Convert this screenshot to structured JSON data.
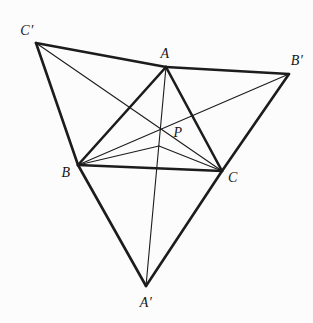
{
  "figure": {
    "background": "#fcfcfc",
    "stroke_color": "#1c1c1c",
    "thick_width": 2.6,
    "thin_width": 1.1,
    "points": {
      "Cp": [
        36,
        43
      ],
      "A": [
        166,
        67
      ],
      "Bp": [
        289,
        74
      ],
      "B": [
        78,
        165
      ],
      "C": [
        222,
        171
      ],
      "Ap": [
        146,
        286
      ],
      "P": [
        161,
        131
      ],
      "Y": [
        159,
        146
      ]
    },
    "segments": [
      {
        "from": "Cp",
        "to": "A",
        "weight": "thick"
      },
      {
        "from": "A",
        "to": "Bp",
        "weight": "thick"
      },
      {
        "from": "Cp",
        "to": "B",
        "weight": "thick"
      },
      {
        "from": "B",
        "to": "Ap",
        "weight": "thick"
      },
      {
        "from": "Bp",
        "to": "C",
        "weight": "thick"
      },
      {
        "from": "C",
        "to": "Ap",
        "weight": "thick"
      },
      {
        "from": "A",
        "to": "B",
        "weight": "thick"
      },
      {
        "from": "B",
        "to": "C",
        "weight": "thick"
      },
      {
        "from": "A",
        "to": "C",
        "weight": "thick"
      },
      {
        "from": "A",
        "to": "Ap",
        "weight": "thin"
      },
      {
        "from": "B",
        "to": "Bp",
        "weight": "thin"
      },
      {
        "from": "Cp",
        "to": "C",
        "weight": "thin"
      },
      {
        "from": "B",
        "to": "Y",
        "weight": "thin"
      },
      {
        "from": "Y",
        "to": "C",
        "weight": "thin"
      }
    ],
    "labels": [
      {
        "name": "label-c-prime",
        "text": "C′",
        "x": 27,
        "y": 31
      },
      {
        "name": "label-a",
        "text": "A",
        "x": 165,
        "y": 54
      },
      {
        "name": "label-b-prime",
        "text": "B′",
        "x": 297,
        "y": 61
      },
      {
        "name": "label-p",
        "text": "P",
        "x": 178,
        "y": 133
      },
      {
        "name": "label-b",
        "text": "B",
        "x": 66,
        "y": 173
      },
      {
        "name": "label-c",
        "text": "C",
        "x": 233,
        "y": 178
      },
      {
        "name": "label-a-prime",
        "text": "A′",
        "x": 146,
        "y": 303
      }
    ]
  }
}
